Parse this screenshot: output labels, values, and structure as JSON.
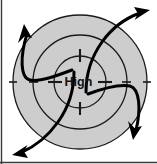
{
  "figure": {
    "kind": "weather-map-diagram",
    "center_label": "High",
    "width": 157,
    "height": 164,
    "background_color": "#ffffff",
    "pressure_field_fill": "#cdcdcd",
    "isobar_stroke": "#1a1a1a",
    "wind_arrow_stroke": "#000000",
    "border_color": "#3a3a3a"
  },
  "center": {
    "cx": 80,
    "cy": 82,
    "label": "High"
  },
  "isobars": [
    {
      "name": "outer-isobar",
      "radius": 67,
      "stroke_width": 1.3
    },
    {
      "name": "middle-isobar",
      "radius": 47,
      "stroke_width": 1.3
    },
    {
      "name": "inner-isobar",
      "radius": 26,
      "stroke_width": 1.3
    }
  ],
  "isobar_ticks": [
    {
      "name": "tick-outer-west",
      "angle_deg": 180,
      "radius": 67
    },
    {
      "name": "tick-outer-east",
      "angle_deg": 0,
      "radius": 67
    },
    {
      "name": "tick-middle-west",
      "angle_deg": 180,
      "radius": 47
    },
    {
      "name": "tick-middle-east",
      "angle_deg": 0,
      "radius": 47
    },
    {
      "name": "tick-inner-west",
      "angle_deg": 180,
      "radius": 26
    },
    {
      "name": "tick-inner-east",
      "angle_deg": 0,
      "radius": 26
    },
    {
      "name": "tick-inner-north",
      "angle_deg": 270,
      "radius": 26
    },
    {
      "name": "tick-inner-south",
      "angle_deg": 90,
      "radius": 26
    }
  ],
  "wind_arrows": [
    {
      "name": "wind-arrow-upper-left",
      "direction": "outflow-upper-left",
      "path": "M 72 70 C 56 76 40 82 30 80 C 20 78 20 56 27 34",
      "arrow_tip": [
        25,
        26
      ],
      "arrow_angle_deg": -76
    },
    {
      "name": "wind-arrow-upper-right",
      "direction": "outflow-upper-right",
      "path": "M 86 92 C 86 74 92 56 102 42 C 112 28 126 18 140 13",
      "arrow_tip": [
        147,
        11
      ],
      "arrow_angle_deg": -16
    },
    {
      "name": "wind-arrow-lower-right",
      "direction": "outflow-lower-right",
      "path": "M 88 94 C 104 88 120 84 130 86 C 140 89 141 110 136 130",
      "arrow_tip": [
        134,
        139
      ],
      "arrow_angle_deg": 77
    },
    {
      "name": "wind-arrow-lower-left",
      "direction": "outflow-lower-left",
      "path": "M 74 72 C 74 90 68 108 58 122 C 48 136 36 146 22 152",
      "arrow_tip": [
        15,
        154
      ],
      "arrow_angle_deg": 162
    }
  ]
}
